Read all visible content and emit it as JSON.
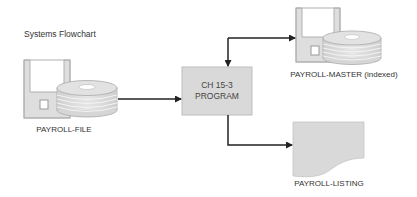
{
  "diagram": {
    "title": "Systems Flowchart",
    "colors": {
      "fill": "#d9d9d9",
      "disk_fill": "#dcdcdc",
      "stroke": "#aaaaaa",
      "arrow": "#222222",
      "text": "#333333"
    },
    "nodes": {
      "input_file": {
        "type": "disk-storage",
        "label": "PAYROLL-FILE"
      },
      "program": {
        "type": "process",
        "line1": "CH 15-3",
        "line2": "PROGRAM"
      },
      "master_file": {
        "type": "disk-storage",
        "label": "PAYROLL-MASTER (indexed)"
      },
      "listing": {
        "type": "document",
        "label": "PAYROLL-LISTING"
      }
    },
    "edges": [
      {
        "from": "input_file",
        "to": "program",
        "direction": "one-way"
      },
      {
        "from": "program",
        "to": "master_file",
        "direction": "two-way"
      },
      {
        "from": "program",
        "to": "listing",
        "direction": "one-way"
      }
    ]
  }
}
